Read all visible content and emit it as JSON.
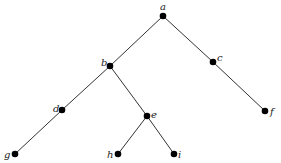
{
  "diagram": {
    "type": "rooted-tree",
    "colors": {
      "edge": "#333333",
      "node": "#000000",
      "label": "#222222",
      "background": "#ffffff"
    },
    "nodes": [
      {
        "id": "a",
        "label": "a",
        "x": 163,
        "y": 16,
        "lx": 160,
        "ly": 10
      },
      {
        "id": "b",
        "label": "b",
        "x": 110,
        "y": 66,
        "lx": 101,
        "ly": 66
      },
      {
        "id": "c",
        "label": "c",
        "x": 213,
        "y": 62,
        "lx": 217,
        "ly": 61
      },
      {
        "id": "d",
        "label": "d",
        "x": 62,
        "y": 110,
        "lx": 53,
        "ly": 112
      },
      {
        "id": "e",
        "label": "e",
        "x": 147,
        "y": 116,
        "lx": 151,
        "ly": 118
      },
      {
        "id": "f",
        "label": "f",
        "x": 265,
        "y": 111,
        "lx": 270,
        "ly": 115
      },
      {
        "id": "g",
        "label": "g",
        "x": 15,
        "y": 154,
        "lx": 4,
        "ly": 158
      },
      {
        "id": "h",
        "label": "h",
        "x": 118,
        "y": 154,
        "lx": 107,
        "ly": 158
      },
      {
        "id": "i",
        "label": "i",
        "x": 174,
        "y": 154,
        "lx": 178,
        "ly": 158
      }
    ],
    "edges": [
      {
        "from": "a",
        "to": "b"
      },
      {
        "from": "a",
        "to": "c"
      },
      {
        "from": "b",
        "to": "d"
      },
      {
        "from": "b",
        "to": "e"
      },
      {
        "from": "c",
        "to": "f"
      },
      {
        "from": "d",
        "to": "g"
      },
      {
        "from": "e",
        "to": "h"
      },
      {
        "from": "e",
        "to": "i"
      }
    ]
  }
}
